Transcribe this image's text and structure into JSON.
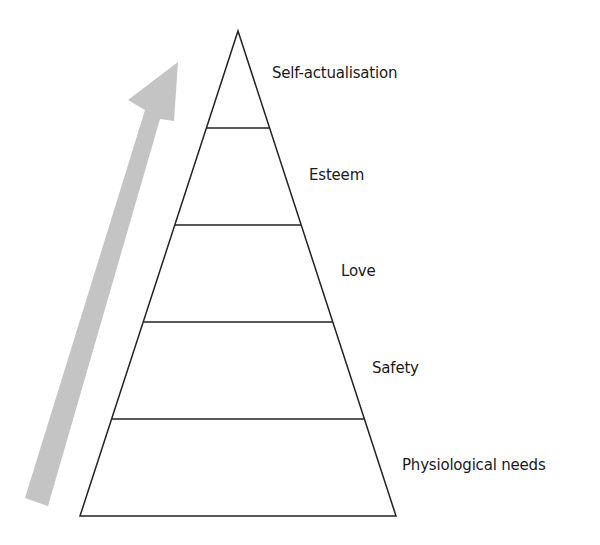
{
  "diagram": {
    "type": "pyramid",
    "title": "",
    "arrow": {
      "direction": "up",
      "color": "#c4c4c4"
    },
    "levels": [
      {
        "label": "Self-actualisation",
        "order": 5
      },
      {
        "label": "Esteem",
        "order": 4
      },
      {
        "label": "Love",
        "order": 3
      },
      {
        "label": "Safety",
        "order": 2
      },
      {
        "label": "Physiological needs",
        "order": 1
      }
    ],
    "line_color": "#222222"
  }
}
